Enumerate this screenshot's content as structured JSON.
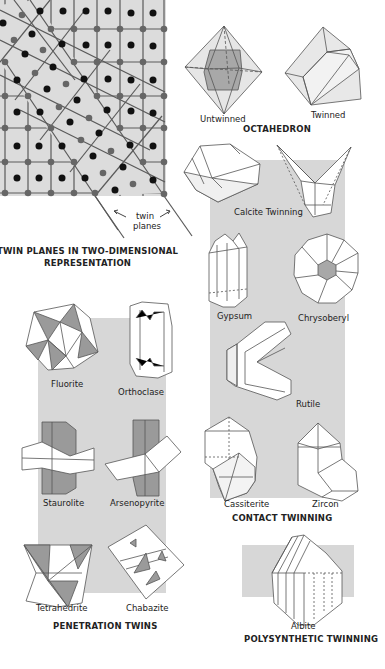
{
  "colors": {
    "background": "#ffffff",
    "grid_bg": "#dcdcdc",
    "panel_gray": "#d7d7d7",
    "face_dark": "#9a9a9a",
    "face_light": "#ffffff",
    "atom_black": "#111111",
    "node_gray": "#666666"
  },
  "twin_planes_diagram": {
    "annotation": "twin planes",
    "annotation_line1": "twin",
    "annotation_line2": "planes",
    "title_line1": "TWIN PLANES IN TWO-DIMENSIONAL",
    "title_line2": "REPRESENTATION"
  },
  "octahedron": {
    "title": "OCTAHEDRON",
    "items": [
      {
        "label": "Untwinned"
      },
      {
        "label": "Twinned"
      }
    ]
  },
  "contact_twinning": {
    "title": "CONTACT TWINNING",
    "items": [
      {
        "label": "Calcite Twinning"
      },
      {
        "label": "Gypsum"
      },
      {
        "label": "Chrysoberyl"
      },
      {
        "label": "Rutile"
      },
      {
        "label": "Cassiterite"
      },
      {
        "label": "Zircon"
      }
    ]
  },
  "penetration_twins": {
    "title": "PENETRATION TWINS",
    "items": [
      {
        "label": "Fluorite"
      },
      {
        "label": "Orthoclase"
      },
      {
        "label": "Staurolite"
      },
      {
        "label": "Arsenopyrite"
      },
      {
        "label": "Tetrahedrite"
      },
      {
        "label": "Chabazite"
      }
    ]
  },
  "polysynthetic_twinning": {
    "title": "POLYSYNTHETIC TWINNING",
    "items": [
      {
        "label": "Albite"
      }
    ]
  }
}
